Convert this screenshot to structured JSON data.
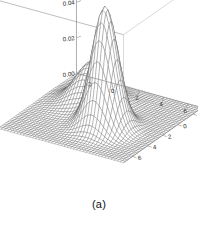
{
  "figure": {
    "caption": "(a)",
    "background_color": "#ffffff",
    "line_color": "#4d4d4d",
    "box_color": "#8c8c8c",
    "text_color": "#2a2a2a"
  },
  "chart_data": {
    "type": "surface",
    "title": "",
    "subtitle": "",
    "xlabel": "",
    "ylabel": "",
    "zlabel": "",
    "grid": false,
    "legend": "none",
    "projection": "persp-wireframe",
    "view": {
      "theta": 32,
      "phi": 26
    },
    "xlim": [
      -3.2,
      7.2
    ],
    "ylim": [
      -3.2,
      7.2
    ],
    "zlim": [
      0,
      0.072
    ],
    "xticks": [
      -2,
      0,
      2,
      4,
      6
    ],
    "yticks": [
      -2,
      0,
      2,
      4,
      6
    ],
    "zticks": [
      0.0,
      0.02,
      0.04,
      0.06
    ],
    "xtick_labels": [
      "-2",
      "0",
      "2",
      "4",
      "6"
    ],
    "ytick_labels": [
      "-2",
      "0",
      "2",
      "4",
      "6"
    ],
    "ztick_labels": [
      "0.00",
      "0.02",
      "0.04",
      "0.06"
    ],
    "mesh": {
      "nx": 40,
      "ny": 40
    },
    "components": [
      {
        "name": "peak-tall",
        "weight": 0.62,
        "mx": 3.1,
        "my": 3.1,
        "sx": 0.95,
        "sy": 0.95,
        "peak_z": 0.068
      },
      {
        "name": "peak-short",
        "weight": 0.38,
        "mx": 0.4,
        "my": 0.4,
        "sx": 1.25,
        "sy": 1.25,
        "peak_z": 0.042
      }
    ],
    "peaks": [
      {
        "label": "tall-peak",
        "x": 3.1,
        "y": 3.1,
        "z": 0.068
      },
      {
        "label": "short-peak",
        "x": 0.4,
        "y": 0.4,
        "z": 0.042
      }
    ],
    "saddle": {
      "x": 1.75,
      "y": 1.75,
      "z": 0.028
    }
  }
}
